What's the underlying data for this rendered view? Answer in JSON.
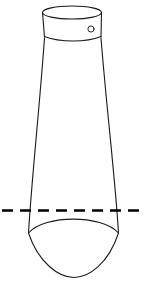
{
  "figure": {
    "background_color": "#ffffff",
    "width": 148,
    "height": 298,
    "stroke_color": "#1a1a1a",
    "cut_line_color": "#000000"
  },
  "geometry": {
    "neck": {
      "name": "cylindrical-neck",
      "rim_ellipse": {
        "cx": 72,
        "cy": 12.5,
        "rx": 29.5,
        "ry": 6.5
      },
      "left_x_top": 42.5,
      "right_x_top": 101.5,
      "left_x_bottom": 44.5,
      "right_x_bottom": 101.0,
      "bottom_y": 36,
      "bottom_arc_sag": 5
    },
    "rivet": {
      "name": "rivet-hole",
      "cx": 91,
      "cy": 29,
      "r": 3.1
    },
    "body": {
      "name": "flaring-body",
      "left_top_x": 44.5,
      "right_top_x": 101.0,
      "top_y": 38,
      "left_bottom_x": 28.5,
      "right_bottom_x": 118.5,
      "bottom_y": 233,
      "left_curve_control": [
        34,
        140
      ],
      "right_curve_control": [
        111,
        140
      ]
    },
    "cut_line": {
      "name": "section-cut-line",
      "y": 210,
      "x_start": 2,
      "x_end": 146,
      "dash_pattern": "11 7",
      "dash_count": 9
    },
    "base_lens": {
      "name": "rounded-base",
      "left_point": [
        28.5,
        233
      ],
      "right_point": [
        118.5,
        233
      ],
      "upper_arc_apex_y": 217,
      "lower_arc_apex_y": 277,
      "lower_arc_apex_x": 74
    }
  },
  "labels": {
    "rim": "",
    "cut": "",
    "base": ""
  }
}
